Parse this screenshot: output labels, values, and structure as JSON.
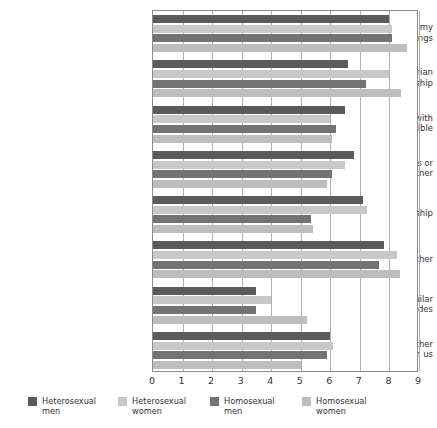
{
  "chart_data": {
    "type": "bar",
    "orientation": "horizontal",
    "title": "",
    "subtitle": "",
    "xlabel": "",
    "ylabel": "",
    "xlim": [
      0,
      9
    ],
    "xticks": [
      "0",
      "1",
      "2",
      "3",
      "4",
      "5",
      "6",
      "7",
      "8",
      "9"
    ],
    "grid": true,
    "legend_position": "bottom",
    "categories": [
      "Being able to talk about my\nmost intimate feelings",
      "Having an egalitarian\nrelationship",
      "Sharing as many activities with\nmy partner as possible",
      "Trying new sexual activities or\ntechniques with my partner",
      "Sexual fidelity in the relationship",
      "Laughing easily with each other",
      "Both of us having similar\npolitical attitudes",
      "Working together on tasks rather\nthan dividing tasks between us"
    ],
    "series": [
      {
        "name": "Heterosexual men",
        "color": "#5b5b5b",
        "values": [
          8.0,
          6.6,
          6.5,
          6.8,
          7.1,
          7.8,
          3.5,
          6.0
        ]
      },
      {
        "name": "Heterosexual women",
        "color": "#c8c8c8",
        "values": [
          8.1,
          8.0,
          6.0,
          6.5,
          7.25,
          8.25,
          4.0,
          6.1
        ]
      },
      {
        "name": "Homosexual men",
        "color": "#737373",
        "values": [
          8.1,
          7.2,
          6.2,
          6.05,
          5.35,
          7.65,
          3.5,
          5.9
        ]
      },
      {
        "name": "Homosexual women",
        "color": "#bdbdbd",
        "values": [
          8.6,
          8.4,
          6.05,
          5.9,
          5.4,
          8.35,
          5.2,
          5.0
        ]
      }
    ]
  },
  "legend": {
    "items": [
      {
        "label": "Heterosexual\nmen",
        "color": "#5b5b5b"
      },
      {
        "label": "Heterosexual\nwomen",
        "color": "#c8c8c8"
      },
      {
        "label": "Homosexual\nmen",
        "color": "#737373"
      },
      {
        "label": "Homosexual\nwomen",
        "color": "#bdbdbd"
      }
    ]
  },
  "colors": {
    "plot_border": "#8b8b8b",
    "gridline": "#b0b0b0",
    "background": "#ffffff",
    "text": "#333333"
  }
}
